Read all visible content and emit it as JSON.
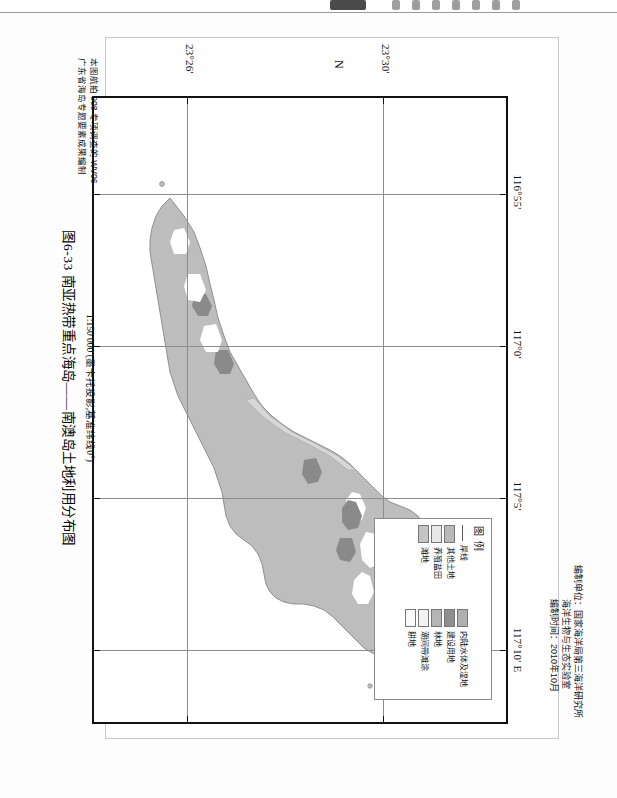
{
  "figure": {
    "caption": "图6-33  南亚热带重点海岛——南澳岛土地利用分布图",
    "scale_text": "1:150 000 (墨卡托投影,基准纬线0°)"
  },
  "credits": {
    "producer_label_line1": "编制单位：国家海洋局第三海洋研究所",
    "producer_label_line2": "海洋生物与生态实验室",
    "date_line": "编制时间：2010年10月"
  },
  "source": {
    "line1": "本图航拍 908 专项调查的 WV06",
    "line2": "广东省海岛专题要素成果编制"
  },
  "legend": {
    "title": "图 例",
    "column_left": [
      {
        "label": "岸线",
        "color": "#5a5a5a",
        "swatch": "line"
      },
      {
        "label": "其他土地",
        "color": "#b9b9b9",
        "swatch": "fill"
      },
      {
        "label": "养殖盐田",
        "color": "#e8e8e8",
        "swatch": "fill"
      },
      {
        "label": "滩地",
        "color": "#c4c4c4",
        "swatch": "fill"
      }
    ],
    "column_right": [
      {
        "label": "内陆水体及湿地",
        "color": "#b0b0b0",
        "swatch": "fill"
      },
      {
        "label": "建设用地",
        "color": "#8f8f8f",
        "swatch": "fill"
      },
      {
        "label": "林地",
        "color": "#b5b5b5",
        "swatch": "fill"
      },
      {
        "label": "潮间带滩涂",
        "color": "#f2f2f2",
        "swatch": "fill"
      },
      {
        "label": "耕地",
        "color": "#fafafa",
        "swatch": "fill"
      }
    ]
  },
  "map": {
    "north_indicator": "N",
    "longitude_ticks": [
      {
        "label": "116°55'",
        "x": 96
      },
      {
        "label": "117°0'",
        "x": 248
      },
      {
        "label": "117°5'",
        "x": 400
      },
      {
        "label": "117°10' E",
        "x": 552
      }
    ],
    "latitude_ticks": [
      {
        "label": "23°26'",
        "y": 318
      },
      {
        "label": "23°30'",
        "y": 122
      }
    ],
    "island_fill": "#bdbdbd",
    "island_stroke": "#8c8c8c",
    "builtup_fill": "#8a8a8a",
    "water_fill": "#ffffff",
    "background": "#ffffff"
  }
}
